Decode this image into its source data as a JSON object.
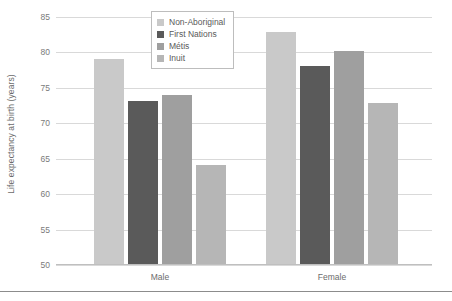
{
  "chart_data": {
    "type": "bar",
    "title": "",
    "xlabel": "",
    "ylabel": "Life expectancy at birth (years)",
    "categories": [
      "Male",
      "Female"
    ],
    "series": [
      {
        "name": "Non-Aboriginal",
        "color": "#c9c9c9",
        "values": [
          79.0,
          82.8
        ]
      },
      {
        "name": "First Nations",
        "color": "#5a5a5a",
        "values": [
          73.0,
          78.0
        ]
      },
      {
        "name": "Métis",
        "color": "#9f9f9f",
        "values": [
          73.8,
          80.0
        ]
      },
      {
        "name": "Inuit",
        "color": "#b6b6b6",
        "values": [
          64.0,
          72.7
        ]
      }
    ],
    "ylim": [
      50,
      85
    ],
    "y_ticks": [
      85,
      80,
      75,
      70,
      65,
      60,
      55,
      50
    ],
    "y_tick_labels": [
      "85",
      "80",
      "75",
      "70",
      "65",
      "60",
      "55",
      "50"
    ],
    "grid": true,
    "legend_position": "top-center"
  },
  "legend": {
    "items": [
      {
        "label": "Non-Aboriginal",
        "swatch_name": "legend-swatch-non-aboriginal"
      },
      {
        "label": "First Nations",
        "swatch_name": "legend-swatch-first-nations"
      },
      {
        "label": "Métis",
        "swatch_name": "legend-swatch-metis"
      },
      {
        "label": "Inuit",
        "swatch_name": "legend-swatch-inuit"
      }
    ]
  },
  "axes": {
    "y_title": "Life expectancy at birth (years)",
    "x_groups": [
      "Male",
      "Female"
    ]
  },
  "colors": {
    "non_aboriginal": "#c9c9c9",
    "first_nations": "#5a5a5a",
    "metis": "#9f9f9f",
    "inuit": "#b6b6b6",
    "gridline": "#d9d9d9",
    "axis": "#bfbfbf",
    "text": "#6b6b6b",
    "rule": "#8c8c8c"
  }
}
